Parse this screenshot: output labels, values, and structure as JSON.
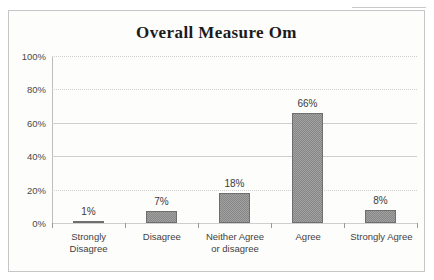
{
  "chart_data": {
    "type": "bar",
    "title": "Overall Measure Om",
    "xlabel": "",
    "ylabel": "",
    "categories": [
      "Strongly Disagree",
      "Disagree",
      "Neither Agree or disagree",
      "Agree",
      "Strongly Agree"
    ],
    "category_lines": [
      [
        "Strongly",
        "Disagree"
      ],
      [
        "Disagree",
        ""
      ],
      [
        "Neither Agree",
        "or disagree"
      ],
      [
        "Agree",
        ""
      ],
      [
        "Strongly Agree",
        ""
      ]
    ],
    "values": [
      1,
      7,
      18,
      66,
      8
    ],
    "value_labels": [
      "1%",
      "7%",
      "18%",
      "66%",
      "8%"
    ],
    "ylim": [
      0,
      100
    ],
    "ytick_values": [
      0,
      20,
      40,
      60,
      80,
      100
    ],
    "ytick_labels": [
      "0%",
      "20%",
      "40%",
      "60%",
      "80%",
      "100%"
    ],
    "grid": true,
    "legend": "none",
    "bar_color": "#878787",
    "gridline_color": "#cfcfcf",
    "axis_color": "#9a9a9a",
    "title_color": "#1b1b1b",
    "background_color": "#fdfdfc"
  }
}
